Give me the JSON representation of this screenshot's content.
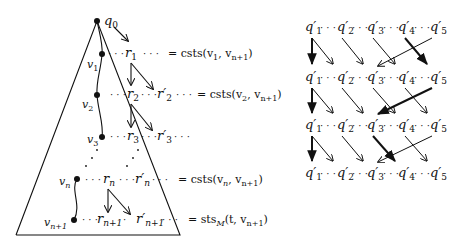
{
  "left": {
    "root_label": "q",
    "root_sub": "0",
    "nodes": [
      {
        "label": "v",
        "sub": "1"
      },
      {
        "label": "v",
        "sub": "2"
      },
      {
        "label": "v",
        "sub": "3"
      },
      {
        "label": "v",
        "sub": "n"
      },
      {
        "label": "v",
        "sub": "n+1"
      }
    ],
    "rows": [
      {
        "r": "r",
        "r_sub": "1",
        "rp_sub": "",
        "eq": "= csts(v",
        "eq_a": "1",
        "eq_mid": ", v",
        "eq_b": "n+1",
        "eq_end": ")"
      },
      {
        "r": "r",
        "r_sub": "2",
        "rp": "r′",
        "rp_sub": "2",
        "eq": "= csts(v",
        "eq_a": "2",
        "eq_mid": ", v",
        "eq_b": "n+1",
        "eq_end": ")"
      },
      {
        "r": "r",
        "r_sub": "3",
        "rp": "r′",
        "rp_sub": "3"
      },
      {
        "r": "r",
        "r_sub": "n",
        "rp": "r′",
        "rp_sub": "n",
        "eq": "= csts(v",
        "eq_a": "n",
        "eq_mid": ", v",
        "eq_b": "n+1",
        "eq_end": ")"
      },
      {
        "r": "r",
        "r_sub": "n+1",
        "rp": "r′",
        "rp_sub": "n+1",
        "eq": "= sts",
        "eq_a": "M",
        "eq_mid": "(t, v",
        "eq_b": "n+1",
        "eq_end": ")"
      }
    ],
    "ellipsis": "· · ·"
  },
  "right": {
    "label": "q′",
    "subs": [
      "1",
      "2",
      "3",
      "4",
      "5"
    ],
    "rows": 4,
    "ellipsis": "· · ·"
  }
}
